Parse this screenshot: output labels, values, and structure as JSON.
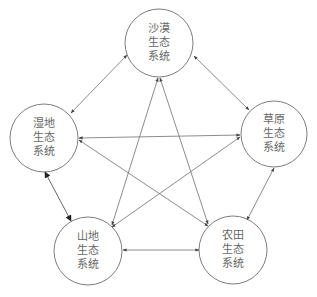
{
  "diagram": {
    "nodes": [
      {
        "id": "desert",
        "lines": [
          "沙漠",
          "生态",
          "系统"
        ],
        "cx": 159,
        "cy": 43,
        "r": 34
      },
      {
        "id": "wetland",
        "lines": [
          "湿地",
          "生态",
          "系统"
        ],
        "cx": 44,
        "cy": 138,
        "r": 34
      },
      {
        "id": "grassland",
        "lines": [
          "草原",
          "生态",
          "系统"
        ],
        "cx": 274,
        "cy": 134,
        "r": 33
      },
      {
        "id": "mountain",
        "lines": [
          "山地",
          "生态",
          "系统"
        ],
        "cx": 88,
        "cy": 251,
        "r": 34
      },
      {
        "id": "farmland",
        "lines": [
          "农田",
          "生态",
          "系统"
        ],
        "cx": 233,
        "cy": 250,
        "r": 34
      }
    ],
    "edges": [
      {
        "from": "desert",
        "to": "wetland",
        "bidirectional": true
      },
      {
        "from": "desert",
        "to": "grassland",
        "bidirectional": true
      },
      {
        "from": "desert",
        "to": "mountain",
        "bidirectional": true
      },
      {
        "from": "desert",
        "to": "farmland",
        "bidirectional": true
      },
      {
        "from": "wetland",
        "to": "grassland",
        "bidirectional": true
      },
      {
        "from": "wetland",
        "to": "farmland",
        "bidirectional": true
      },
      {
        "from": "wetland",
        "to": "mountain",
        "bidirectional": true
      },
      {
        "from": "grassland",
        "to": "mountain",
        "bidirectional": true
      },
      {
        "from": "grassland",
        "to": "farmland",
        "bidirectional": true
      },
      {
        "from": "mountain",
        "to": "farmland",
        "bidirectional": true
      }
    ],
    "colors": {
      "stroke": "#6e6e6e",
      "text": "#666666",
      "background": "#ffffff"
    }
  }
}
